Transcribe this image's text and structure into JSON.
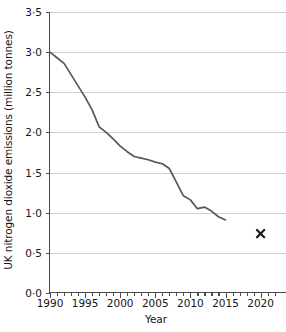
{
  "chart_data": {
    "type": "line",
    "title": "",
    "xlabel": "Year",
    "ylabel": "UK nitrogen dioxide emissions (million tonnes)",
    "xlim": [
      1989,
      2022
    ],
    "ylim": [
      0.0,
      3.5
    ],
    "grid": true,
    "legend": null,
    "x_tick_labels": [
      "1990",
      "1995",
      "2000",
      "2005",
      "2010",
      "2015",
      "2020"
    ],
    "x_tick_values": [
      1990,
      1995,
      2000,
      2005,
      2010,
      2015,
      2020
    ],
    "x_minor_tick_step": 1,
    "y_tick_labels": [
      "0·0",
      "0·5",
      "1·0",
      "1·5",
      "2·0",
      "2·5",
      "3·0",
      "3·5"
    ],
    "y_tick_values": [
      0.0,
      0.5,
      1.0,
      1.5,
      2.0,
      2.5,
      3.0,
      3.5
    ],
    "series": [
      {
        "name": "UK nitrogen dioxide emissions",
        "style": "line",
        "color": "#585858",
        "x": [
          1990,
          1991,
          1992,
          1993,
          1994,
          1995,
          1996,
          1997,
          1998,
          1999,
          2000,
          2001,
          2002,
          2003,
          2004,
          2005,
          2006,
          2007,
          2008,
          2009,
          2010,
          2011,
          2012,
          2013,
          2014,
          2015
        ],
        "values": [
          3.0,
          2.93,
          2.86,
          2.72,
          2.58,
          2.44,
          2.28,
          2.07,
          2.0,
          1.92,
          1.83,
          1.76,
          1.7,
          1.68,
          1.66,
          1.63,
          1.61,
          1.55,
          1.38,
          1.21,
          1.16,
          1.05,
          1.07,
          1.02,
          0.95,
          0.91
        ]
      },
      {
        "name": "Target point",
        "style": "marker",
        "marker": "x",
        "color": "#1a1a1a",
        "x": [
          2020
        ],
        "values": [
          0.74
        ]
      }
    ]
  },
  "axes": {
    "y_title": "UK nitrogen dioxide emissions (million tonnes)",
    "x_title": "Year"
  }
}
